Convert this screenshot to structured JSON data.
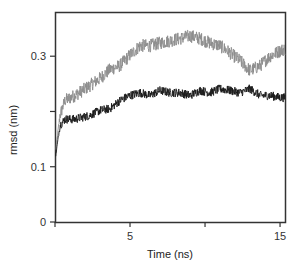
{
  "chart_data": {
    "type": "line",
    "title": "",
    "xlabel": "Time (ns)",
    "ylabel": "rmsd (nm)",
    "xlim": [
      0,
      15.33
    ],
    "ylim": [
      0,
      0.38
    ],
    "grid": false,
    "legend": null,
    "x_ticks": [
      {
        "value": 0,
        "label": ""
      },
      {
        "value": 5,
        "label": "5"
      },
      {
        "value": 10,
        "label": ""
      },
      {
        "value": 15,
        "label": "15"
      }
    ],
    "y_ticks": [
      {
        "value": 0,
        "label": "0"
      },
      {
        "value": 0.1,
        "label": "0.1"
      },
      {
        "value": 0.2,
        "label": ""
      },
      {
        "value": 0.3,
        "label": "0.3"
      }
    ],
    "series": [
      {
        "name": "gray trace",
        "color": "#8c8c8c",
        "noise": 0.012,
        "x": [
          0.05,
          0.33,
          0.67,
          1.33,
          2.33,
          3,
          3.67,
          4.33,
          5,
          5.67,
          6.33,
          7,
          7.67,
          8.33,
          9,
          9.67,
          10.33,
          11,
          11.67,
          12.33,
          13,
          13.67,
          14.33,
          15,
          15.33
        ],
        "values": [
          0.13,
          0.193,
          0.22,
          0.229,
          0.247,
          0.26,
          0.276,
          0.283,
          0.302,
          0.319,
          0.319,
          0.324,
          0.328,
          0.332,
          0.337,
          0.332,
          0.324,
          0.319,
          0.306,
          0.292,
          0.274,
          0.283,
          0.3,
          0.31,
          0.313
        ]
      },
      {
        "name": "black trace",
        "color": "#1a1a1a",
        "noise": 0.008,
        "x": [
          0.05,
          0.33,
          0.67,
          1.33,
          2.33,
          3,
          3.67,
          4.33,
          5,
          5.67,
          6.33,
          7,
          7.67,
          8.33,
          9,
          9.67,
          10.33,
          11,
          11.67,
          12.33,
          13,
          13.67,
          14.33,
          15,
          15.33
        ],
        "values": [
          0.12,
          0.175,
          0.186,
          0.186,
          0.193,
          0.202,
          0.205,
          0.22,
          0.229,
          0.234,
          0.229,
          0.238,
          0.234,
          0.234,
          0.229,
          0.238,
          0.234,
          0.241,
          0.238,
          0.234,
          0.241,
          0.229,
          0.229,
          0.225,
          0.225
        ]
      }
    ]
  }
}
